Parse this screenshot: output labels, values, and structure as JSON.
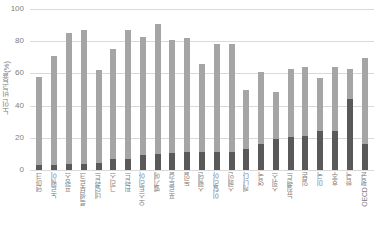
{
  "chart_data": {
    "type": "bar",
    "stacked": true,
    "title": "",
    "subtitle": "",
    "xlabel": "",
    "ylabel": "노인 빈곤율(%)",
    "ylim": [
      0,
      100
    ],
    "yticks": [
      0,
      20,
      40,
      60,
      80,
      100
    ],
    "ytick_labels": [
      "0",
      "20",
      "40",
      "60",
      "80",
      "100"
    ],
    "grid": true,
    "legend": "none",
    "categories": [
      "덴마크",
      "노르웨이",
      "프랑스",
      "룩셈부르크",
      "네덜란드",
      "그리스",
      "핀란드",
      "오스트리아",
      "벨기에",
      "포르투갈",
      "독일",
      "스웨덴",
      "이탈리아",
      "스페인",
      "캐나다",
      "영국",
      "스위스",
      "뉴질랜드",
      "일본",
      "미국",
      "호주",
      "한국",
      "OECD 평균"
    ],
    "series": [
      {
        "name": "하단(짙은 회색)",
        "color": "#595959",
        "values": [
          3,
          3,
          3.5,
          4,
          4.5,
          7,
          7,
          9.5,
          10,
          10.5,
          11,
          11.5,
          11.5,
          11.5,
          13,
          16,
          19.5,
          20.5,
          21,
          24,
          24.5,
          44,
          16
        ]
      },
      {
        "name": "상단(옅은 회색)",
        "color": "#a5a5a5",
        "values": [
          55,
          68,
          81.5,
          83,
          57.5,
          68,
          80,
          73,
          80.5,
          70,
          71,
          54.5,
          66.5,
          66.5,
          36.5,
          45,
          29,
          42.5,
          43,
          33,
          39.5,
          18.5,
          53.5
        ]
      }
    ],
    "totals": [
      58,
      71,
      85,
      87,
      62,
      75,
      87,
      82.5,
      90.5,
      80.5,
      82,
      66,
      78,
      78,
      49.5,
      61,
      48.5,
      63,
      64,
      57,
      64,
      62.5,
      69.5
    ]
  },
  "colors": {
    "segment_top": "#a5a5a5",
    "segment_bottom": "#595959",
    "gridline": "#d9d9d9",
    "text": "#808080",
    "background": "#ffffff"
  },
  "caption": ""
}
